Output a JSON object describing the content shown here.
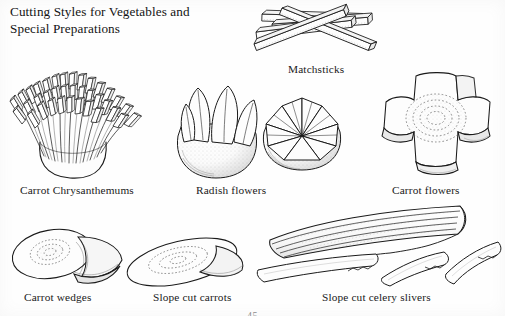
{
  "page": {
    "background_color": "#fefefe",
    "ink_color": "#1a1a1a",
    "page_number": "45"
  },
  "title": {
    "line1": "Cutting Styles for Vegetables and",
    "line2": "Special Preparations"
  },
  "figures": [
    {
      "id": "carrot-chrysanthemums",
      "caption": "Carrot Chrysanthemums",
      "description": "Bundle of fine carrot matchstick strips splayed outward from a rounded cup-shaped base, resembling a chrysanthemum blossom"
    },
    {
      "id": "matchsticks",
      "caption": "Matchsticks",
      "description": "Five long square-sided batons of carrot crisscrossed in a loose pile"
    },
    {
      "id": "radish-flowers",
      "caption": "Radish flowers",
      "description": "Two stippled radishes cut into petals; one with four tall rounded petals, one opened into six triangular petals"
    },
    {
      "id": "carrot-flowers",
      "caption": "Carrot flowers",
      "description": "Thick carrot slice channel-cut into a four-lobed cross shape showing concentric core rings"
    },
    {
      "id": "carrot-wedges",
      "caption": "Carrot wedges",
      "description": "Carrot cut on a steep bias into a wedge, showing the oval cut face with core ring"
    },
    {
      "id": "slope-cut-carrots",
      "caption": "Slope cut carrots",
      "description": "Carrot cut on a long diagonal into an elongated oval slice with visible core rings"
    },
    {
      "id": "slope-cut-celery-slivers",
      "caption": "Slope cut celery slivers",
      "description": "Curved celery stalk sliced on a long slope with three thin slivers falling away in front"
    }
  ]
}
